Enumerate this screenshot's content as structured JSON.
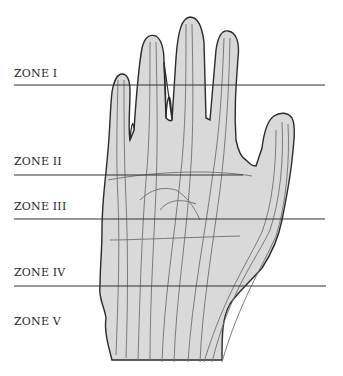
{
  "diagram": {
    "zones": [
      {
        "label": "ZONE I",
        "label_x": 14,
        "label_y": 67,
        "line_y": 85,
        "line_x1": 14,
        "line_x2": 325
      },
      {
        "label": "ZONE II",
        "label_x": 14,
        "label_y": 155,
        "line_y": 175,
        "line_x1": 14,
        "line_x2": 243
      },
      {
        "label": "ZONE III",
        "label_x": 14,
        "label_y": 200,
        "line_y": 219,
        "line_x1": 14,
        "line_x2": 325
      },
      {
        "label": "ZONE IV",
        "label_x": 14,
        "label_y": 266,
        "line_y": 286,
        "line_x1": 14,
        "line_x2": 326
      },
      {
        "label": "ZONE V",
        "label_x": 14,
        "label_y": 315,
        "line_y": null
      }
    ],
    "colors": {
      "line": "#333333",
      "outline": "#2b2b2b",
      "fill": "#d9d9d9",
      "tendon": "#6e6e6e",
      "text": "#2a2a2a"
    }
  }
}
